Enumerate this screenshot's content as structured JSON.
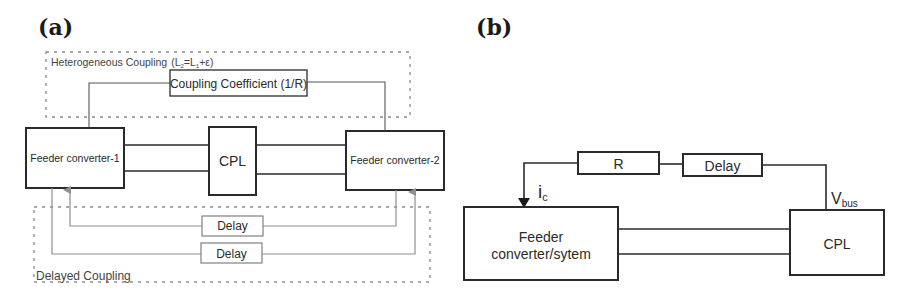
{
  "panel_a": {
    "label": "(a)",
    "heterogeneous_group": {
      "title": "Heterogeneous Coupling",
      "formula_open": "(L",
      "formula_sub1": "2",
      "formula_mid": "=L",
      "formula_sub2": "1",
      "formula_close": "+ε)"
    },
    "coupling_coefficient": "Coupling Coefficient (1/R)",
    "feeder_1": "Feeder converter-1",
    "cpl": "CPL",
    "feeder_2": "Feeder converter-2",
    "delayed_group": {
      "title": "Delayed Coupling",
      "delay_1": "Delay",
      "delay_2": "Delay"
    }
  },
  "panel_b": {
    "label": "(b)",
    "resistor": "R",
    "delay": "Delay",
    "current_label": "i",
    "current_sub": "c",
    "voltage_label": "V",
    "voltage_sub": "bus",
    "feeder_line1": "Feeder",
    "feeder_line2": "converter/sytem",
    "cpl": "CPL"
  }
}
